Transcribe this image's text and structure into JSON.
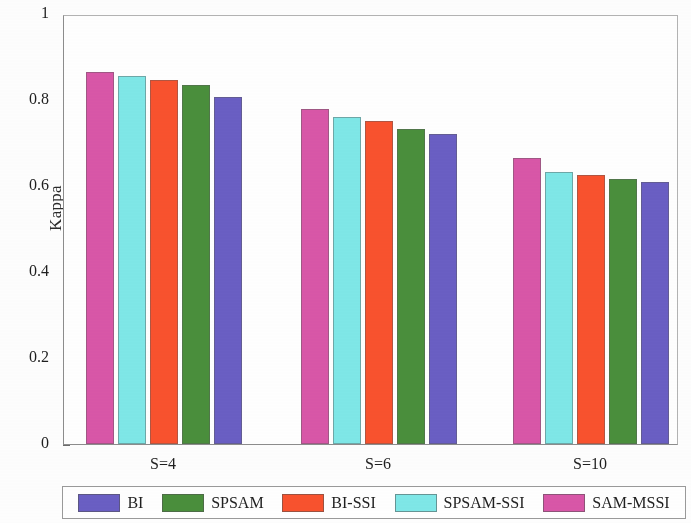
{
  "chart_data": {
    "type": "bar",
    "title": "",
    "xlabel": "",
    "ylabel": "Kappa",
    "ylim": [
      0,
      1
    ],
    "yticks": [
      "0",
      "0.2",
      "0.4",
      "0.6",
      "0.8",
      "1"
    ],
    "ytick_values": [
      0,
      0.2,
      0.4,
      0.6,
      0.8,
      1
    ],
    "grid": false,
    "legend_position": "bottom-outside",
    "categories": [
      "S=4",
      "S=6",
      "S=10"
    ],
    "bar_draw_order": [
      "SAM-MSSI",
      "SPSAM-SSI",
      "BI-SSI",
      "SPSAM",
      "BI"
    ],
    "series": [
      {
        "name": "BI",
        "color": "#6a5fc4",
        "values": [
          0.807,
          0.721,
          0.609
        ]
      },
      {
        "name": "SPSAM",
        "color": "#4a8f3c",
        "values": [
          0.835,
          0.733,
          0.616
        ]
      },
      {
        "name": "BI-SSI",
        "color": "#f9522e",
        "values": [
          0.847,
          0.751,
          0.626
        ]
      },
      {
        "name": "SPSAM-SSI",
        "color": "#7fe8e8",
        "values": [
          0.856,
          0.76,
          0.633
        ]
      },
      {
        "name": "SAM-MSSI",
        "color": "#d957a8",
        "values": [
          0.865,
          0.779,
          0.665
        ]
      }
    ]
  },
  "legend": {
    "entries": [
      {
        "label": "BI",
        "color": "#6a5fc4"
      },
      {
        "label": "SPSAM",
        "color": "#4a8f3c"
      },
      {
        "label": "BI-SSI",
        "color": "#f9522e"
      },
      {
        "label": "SPSAM-SSI",
        "color": "#7fe8e8"
      },
      {
        "label": "SAM-MSSI",
        "color": "#d957a8"
      }
    ]
  },
  "axes": {
    "y_label": "Kappa",
    "y_ticks": [
      "1",
      "0.8",
      "0.6",
      "0.4",
      "0.2",
      "0"
    ],
    "x_ticks": [
      "S=4",
      "S=6",
      "S=10"
    ]
  }
}
